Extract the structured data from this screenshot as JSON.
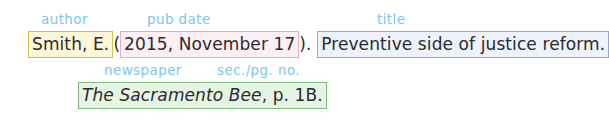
{
  "diagram": {
    "type": "apa-citation-breakdown",
    "background_color": "#ffffff",
    "annotation_color": "#7fc4e8"
  },
  "annotations": [
    {
      "id": "author",
      "label": "author"
    },
    {
      "id": "pub_date",
      "label": "pub date"
    },
    {
      "id": "title",
      "label": "title"
    },
    {
      "id": "newspaper",
      "label": "newspaper"
    },
    {
      "id": "sec_pg_no",
      "label": "sec./pg. no."
    }
  ],
  "citation": {
    "line1": {
      "author": "Smith, E.",
      "open_paren": "(",
      "pub_date": "2015, November 17",
      "close_paren_period": ").",
      "title": "Preventive side of justice reform."
    },
    "line2": {
      "newspaper": "The Sacramento Bee",
      "sec_pg_no": ", p. 1B."
    }
  },
  "colors": {
    "author_border": "#ccc24a",
    "author_fill": "#fbf7d8",
    "date_border": "#f0a8c4",
    "date_fill": "#fdf0f5",
    "title_border": "#9aa6cc",
    "title_fill": "#eef2fa",
    "source_border": "#7bb87a",
    "source_fill": "#e6f4e4",
    "label_blue": "#7fc4e8",
    "text_black": "#2b2b2b"
  }
}
